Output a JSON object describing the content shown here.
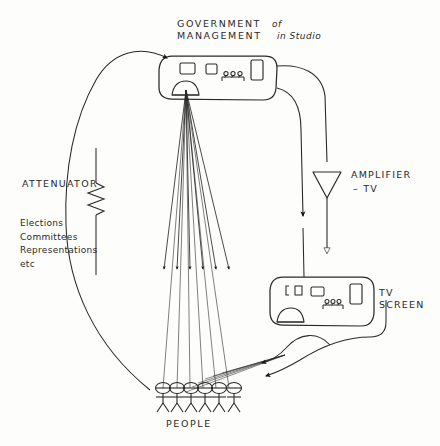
{
  "diagram": {
    "title_line1": "GOVERNMENT",
    "title_line1_suffix": "of",
    "title_line2": "MANAGEMENT",
    "title_line2_suffix": "in Studio",
    "attenuator_label": "ATTENUATOR",
    "attenuator_items": "Elections\nCommittees\nRepresentations\netc",
    "amplifier_label_line1": "AMPLIFIER",
    "amplifier_label_line2": "– TV",
    "tv_label_line1": "TV",
    "tv_label_line2": "SCREEN",
    "people_label": "PEOPLE",
    "ink_color": "#2b2a28",
    "background_color": "#fdfdfc",
    "people_count": 6,
    "broadcast_rays": 6,
    "console_controls": {
      "small_squares": 2,
      "knob_row_label": "RRR",
      "tall_rectangle": 1,
      "dome": 1
    },
    "tv_controls": {
      "small_squares": 3,
      "knob_row_label": "RRR",
      "tall_rectangle": 1,
      "dome": 1
    },
    "shapes": {
      "console": "rounded-rectangle",
      "tv_screen": "rounded-rectangle",
      "amplifier": "down-triangle",
      "attenuator": "resistor-zigzag"
    }
  }
}
